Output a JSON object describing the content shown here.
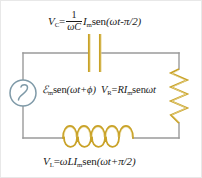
{
  "figure": {
    "width": 202,
    "height": 178,
    "background_color": "#ffffff",
    "border_color": "#e8e8e8"
  },
  "colors": {
    "wire": "#9a9a9a",
    "component_gold": "#c9a227",
    "component_gold_light": "#e3cc7a",
    "source_blue": "#7f9aa8",
    "text": "#1a1a1a"
  },
  "equations": {
    "capacitor": {
      "lhs_symbol": "V",
      "lhs_subscript": "C",
      "equals": "=",
      "fraction_numerator": "1",
      "fraction_denominator": "ωC",
      "current_symbol": "I",
      "current_subscript": "m",
      "function": "sen",
      "argument": "(ωt-π/2)",
      "plain": "V_C = (1/ωC) I_m sen(ωt-π/2)"
    },
    "source": {
      "emf_symbol": "ℰ",
      "emf_subscript": "m",
      "function": "sen",
      "argument": "(ωt+ϕ)",
      "plain": "ℰ_m sen(ωt+ϕ)"
    },
    "resistor": {
      "lhs_symbol": "V",
      "lhs_subscript": "R",
      "equals": "=",
      "coefficient": "RI",
      "coefficient_subscript": "m",
      "function": "sen",
      "argument": "ωt",
      "plain": "V_R = RI_m sen ωt"
    },
    "inductor": {
      "lhs_symbol": "V",
      "lhs_subscript": "L",
      "equals": "=",
      "coefficient": "ωLI",
      "coefficient_subscript": "m",
      "function": "sen",
      "argument": "(ωt+π/2)",
      "plain": "V_L = ωLI_m sen(ωt+π/2)"
    }
  },
  "components": {
    "ac_source": {
      "name": "ac-voltage-source",
      "shape": "circle-with-sine",
      "cx": 28,
      "cy": 92,
      "r": 13
    },
    "capacitor": {
      "name": "capacitor",
      "plate_left_x": 88,
      "plate_right_x": 99,
      "plate_top_y": 33,
      "plate_bottom_y": 71
    },
    "resistor": {
      "name": "resistor",
      "x": 178,
      "y_top": 68,
      "y_bottom": 122,
      "zigzag_peaks": 7,
      "amplitude": 8
    },
    "inductor": {
      "name": "inductor",
      "x_start": 62,
      "x_end": 132,
      "y": 137,
      "loops": 5
    },
    "wires": {
      "name": "circuit-loop",
      "left_x": 22,
      "right_x": 178,
      "top_y": 52,
      "bottom_y": 137
    }
  }
}
